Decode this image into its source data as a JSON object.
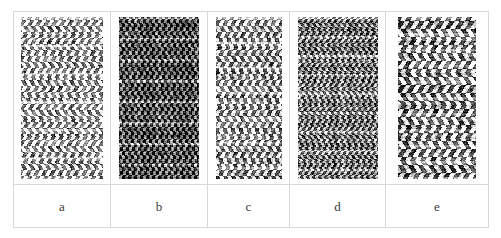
{
  "figure": {
    "background_color": "#ffffff",
    "border_color": "#d8d8d8",
    "label_color": "#3a3a3a",
    "width": 501,
    "height": 238
  },
  "panels": [
    {
      "label": "a",
      "name": "texture-panel-a",
      "description": "light chevron herringbone weave",
      "cell_width": 97,
      "image_width": 82,
      "image_height": 162,
      "mean_gray": 0.72,
      "contrast": 0.95,
      "cell_px": 3,
      "zigzag_amplitude": 2.6,
      "zigzag_period": 17,
      "warp_period": 4,
      "weft_period": 3,
      "band_period": 28,
      "seed": 11
    },
    {
      "label": "b",
      "name": "texture-panel-b",
      "description": "dark dense vertical rib weave",
      "cell_width": 97,
      "image_width": 80,
      "image_height": 162,
      "mean_gray": 0.3,
      "contrast": 0.78,
      "cell_px": 3,
      "zigzag_amplitude": 1.0,
      "zigzag_period": 12,
      "warp_period": 3,
      "weft_period": 2,
      "band_period": 21,
      "seed": 27
    },
    {
      "label": "c",
      "name": "texture-panel-c",
      "description": "medium contrast twill weave",
      "cell_width": 82,
      "image_width": 66,
      "image_height": 162,
      "mean_gray": 0.62,
      "contrast": 0.92,
      "cell_px": 3,
      "zigzag_amplitude": 2.0,
      "zigzag_period": 15,
      "warp_period": 4,
      "weft_period": 3,
      "band_period": 25,
      "seed": 43
    },
    {
      "label": "d",
      "name": "texture-panel-d",
      "description": "medium dark fine grain weave",
      "cell_width": 96,
      "image_width": 80,
      "image_height": 162,
      "mean_gray": 0.46,
      "contrast": 0.8,
      "cell_px": 2,
      "zigzag_amplitude": 1.4,
      "zigzag_period": 11,
      "warp_period": 3,
      "weft_period": 2,
      "band_period": 19,
      "seed": 61
    },
    {
      "label": "e",
      "name": "texture-panel-e",
      "description": "coarse high contrast banded weave",
      "cell_width": 102,
      "image_width": 78,
      "image_height": 162,
      "mean_gray": 0.6,
      "contrast": 1.0,
      "cell_px": 4,
      "zigzag_amplitude": 3.2,
      "zigzag_period": 22,
      "warp_period": 5,
      "weft_period": 4,
      "band_period": 16,
      "seed": 83
    }
  ]
}
